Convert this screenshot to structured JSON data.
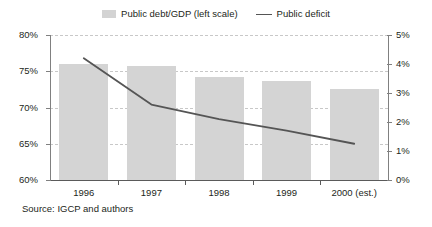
{
  "legend": {
    "entries": [
      {
        "label": "Public debt/GDP (left scale)",
        "marker": "bar-swatch-icon",
        "color": "#d3d3d3"
      },
      {
        "label": "Public deficit",
        "marker": "line-swatch-icon",
        "color": "#555555"
      }
    ]
  },
  "source": {
    "text": "Source: IGCP and authors"
  },
  "chart_data": {
    "type": "bar",
    "title": "",
    "subtitle": "",
    "xlabel": "",
    "ylabel": "",
    "grid": true,
    "legend_position": "top-center",
    "categories": [
      "1996",
      "1997",
      "1998",
      "1999",
      "2000 (est.)"
    ],
    "series": [
      {
        "name": "Public debt/GDP (left scale)",
        "type": "bar",
        "axis": "left",
        "color": "#d4d4d4",
        "unit": "%",
        "values": [
          76.0,
          75.7,
          74.2,
          73.6,
          72.5
        ]
      },
      {
        "name": "Public deficit",
        "type": "line",
        "axis": "right",
        "color": "#555555",
        "unit": "%",
        "values": [
          4.2,
          2.6,
          2.1,
          1.7,
          1.25
        ]
      }
    ],
    "axes": {
      "left": {
        "label": "",
        "ylim": [
          60,
          80
        ],
        "ticks": [
          60,
          65,
          70,
          75,
          80
        ],
        "tick_labels": [
          "60%",
          "65%",
          "70%",
          "75%",
          "80%"
        ]
      },
      "right": {
        "label": "",
        "ylim": [
          0,
          5
        ],
        "ticks": [
          0,
          1,
          2,
          3,
          4,
          5
        ],
        "tick_labels": [
          "0%",
          "1%",
          "2%",
          "3%",
          "4%",
          "5%"
        ]
      },
      "x": {
        "tick_labels": [
          "1996",
          "1997",
          "1998",
          "1999",
          "2000 (est.)"
        ]
      }
    }
  }
}
